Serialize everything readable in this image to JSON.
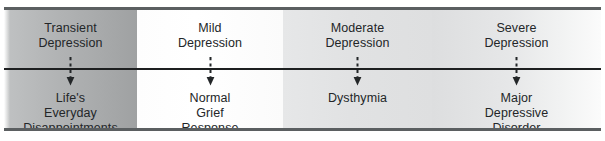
{
  "figure": {
    "type": "depression-severity-continuum",
    "orientation": "horizontal",
    "frame_color": "#5b5f61",
    "axis_color": "#1d1f20",
    "text_color": "#232628"
  },
  "columns": [
    {
      "severity_label": "Transient\nDepression",
      "outcome_label": "Life's\nEveryday\nDisappointments",
      "shade": "#b3b5b6",
      "arrow": "dashed-down-arrow"
    },
    {
      "severity_label": "Mild\nDepression",
      "outcome_label": "Normal\nGrief\nResponse",
      "shade": "#ffffff",
      "arrow": "dashed-down-arrow"
    },
    {
      "severity_label": "Moderate\nDepression",
      "outcome_label": "Dysthymia",
      "shade": "#e1e2e3",
      "arrow": "dashed-down-arrow"
    },
    {
      "severity_label": "Severe\nDepression",
      "outcome_label": "Major\nDepressive\nDisorder",
      "shade": "#e6e7e8",
      "arrow": "dashed-down-arrow"
    }
  ]
}
